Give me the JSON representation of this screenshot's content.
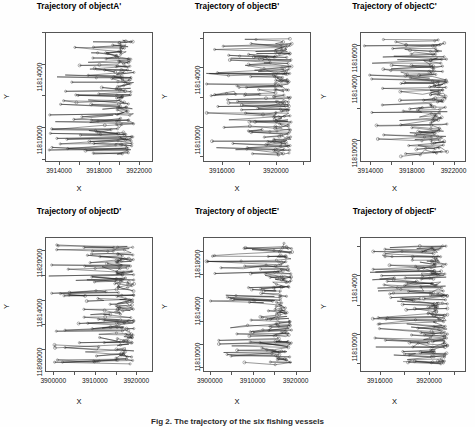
{
  "figure": {
    "caption": "Fig 2. The trajectory of the six fishing vessels",
    "background": "#ffffff",
    "axis_color": "#555555",
    "trace_color": "#1a1a1a"
  },
  "chart_data": {
    "type": "scatter",
    "layout": {
      "rows": 2,
      "cols": 3,
      "grid": false,
      "legend": null
    },
    "shared": {
      "xlabel": "X",
      "ylabel": "Y",
      "marker": "open-circle",
      "connected": true
    },
    "panels": [
      {
        "id": "A",
        "title": "Trajectory of objectA'",
        "xlabel": "X",
        "ylabel": "Y",
        "xticks": [
          3914000,
          3918000,
          3922000
        ],
        "xticklabels": [
          "3914000",
          "3918000",
          "3922000"
        ],
        "yticks": [
          11810000,
          11814000
        ],
        "yticklabels": [
          "11810000",
          "11814000"
        ],
        "xlim": [
          3912600,
          3923400
        ],
        "ylim": [
          11807800,
          11816000
        ],
        "n_points": 210
      },
      {
        "id": "B",
        "title": "Trajectory of objectB'",
        "xlabel": "X",
        "ylabel": "Y",
        "xticks": [
          3916000,
          3920000
        ],
        "xticklabels": [
          "3916000",
          "3920000"
        ],
        "yticks": [
          11810000,
          11814000
        ],
        "yticklabels": [
          "11810000",
          "11814000"
        ],
        "xlim": [
          3914600,
          3922600
        ],
        "ylim": [
          11807600,
          11816400
        ],
        "n_points": 230
      },
      {
        "id": "C",
        "title": "Trajectory of objectC'",
        "xlabel": "X",
        "ylabel": "Y",
        "xticks": [
          3914000,
          3918000,
          3922000
        ],
        "xticklabels": [
          "3914000",
          "3918000",
          "3922000"
        ],
        "yticks": [
          11810000,
          11814000,
          11816000
        ],
        "yticklabels": [
          "11810000",
          "11814000",
          "11816000"
        ],
        "xlim": [
          3913000,
          3923200
        ],
        "ylim": [
          11808600,
          11816800
        ],
        "n_points": 200
      },
      {
        "id": "D",
        "title": "Trajectory of objectD'",
        "xlabel": "X",
        "ylabel": "Y",
        "xticks": [
          3900000,
          3910000,
          3920000
        ],
        "xticklabels": [
          "3900000",
          "3910000",
          "3920000"
        ],
        "yticks": [
          11808000,
          11814000,
          11820000
        ],
        "yticklabels": [
          "11808000",
          "11814000",
          "11820000"
        ],
        "xlim": [
          3898000,
          3924000
        ],
        "ylim": [
          11805200,
          11821600
        ],
        "n_points": 240
      },
      {
        "id": "E",
        "title": "Trajectory of objectE'",
        "xlabel": "X",
        "ylabel": "Y",
        "xticks": [
          3900000,
          3910000,
          3920000
        ],
        "xticklabels": [
          "3900000",
          "3910000",
          "3920000"
        ],
        "yticks": [
          11810000,
          11814000,
          11818000
        ],
        "yticklabels": [
          "11810000",
          "11814000",
          "11818000"
        ],
        "xlim": [
          3898400,
          3923600
        ],
        "ylim": [
          11807600,
          11819200
        ],
        "n_points": 220
      },
      {
        "id": "F",
        "title": "Trajectory of objectF'",
        "xlabel": "X",
        "ylabel": "Y",
        "xticks": [
          3916000,
          3920000
        ],
        "xticklabels": [
          "3916000",
          "3920000"
        ],
        "yticks": [
          11810000,
          11814000
        ],
        "yticklabels": [
          "11810000",
          "11814000"
        ],
        "xlim": [
          3914400,
          3923000
        ],
        "ylim": [
          11807400,
          11816600
        ],
        "n_points": 250
      }
    ]
  }
}
